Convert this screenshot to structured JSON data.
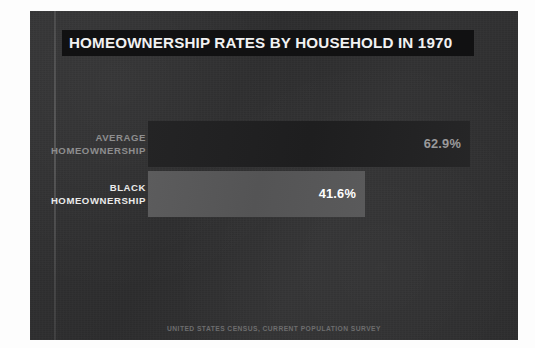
{
  "panel": {
    "background_color": "#303031",
    "page_background_color": "#fdfdfd"
  },
  "header": {
    "title": "HOMEOWNERSHIP RATES BY HOUSEHOLD IN 1970",
    "band_color": "#111112",
    "title_color": "#f2f2f2"
  },
  "footer": {
    "source": "UNITED STATES CENSUS, CURRENT POPULATION SURVEY",
    "color": "#6d6d6e"
  },
  "chart_data": {
    "type": "bar",
    "orientation": "horizontal",
    "title": "HOMEOWNERSHIP RATES BY HOUSEHOLD IN 1970",
    "xlabel": "",
    "ylabel": "",
    "xlim": [
      0,
      100
    ],
    "grid": false,
    "legend": "none",
    "source": "UNITED STATES CENSUS, CURRENT POPULATION SURVEY",
    "categories": [
      "AVERAGE HOMEOWNERSHIP",
      "BLACK HOMEOWNERSHIP"
    ],
    "values": [
      62.9,
      41.6
    ],
    "value_labels": [
      "62.9%",
      "41.6%"
    ],
    "bars": [
      {
        "key": "average",
        "label_line1": "AVERAGE",
        "label_line2": "HOMEOWNERSHIP",
        "value": 62.9,
        "value_label": "62.9%",
        "bar_color": "#232324",
        "label_color": "#8e8e8f",
        "value_color": "#9a9a9b"
      },
      {
        "key": "black",
        "label_line1": "BLACK",
        "label_line2": "HOMEOWNERSHIP",
        "value": 41.6,
        "value_label": "41.6%",
        "bar_color": "#585859",
        "label_color": "#eaeaea",
        "value_color": "#ffffff"
      }
    ]
  }
}
